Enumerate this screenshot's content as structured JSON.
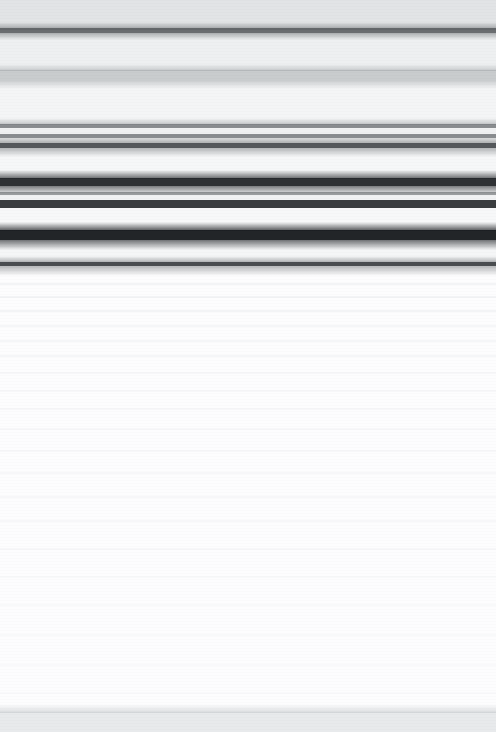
{
  "capture": {
    "width": 496,
    "height": 732,
    "condition": "horizontal-motion-blur",
    "legible_text": "none",
    "page_background": "#fdfdfe"
  },
  "regions": [
    {
      "name": "title-bar",
      "top": 0,
      "height": 28,
      "color": "#e2e4e6"
    },
    {
      "name": "title-bar-border",
      "top": 28,
      "height": 5,
      "color": "#6a6d70"
    },
    {
      "name": "secondary-bar",
      "top": 33,
      "height": 37,
      "color": "#eef0f1"
    },
    {
      "name": "section-header-band",
      "top": 70,
      "height": 11,
      "color": "#c9ccce"
    },
    {
      "name": "panel-upper",
      "top": 81,
      "height": 43,
      "color": "#f4f5f6"
    },
    {
      "name": "row-rule-1",
      "top": 124,
      "height": 4,
      "color": "#8a8d90"
    },
    {
      "name": "row-gap-1",
      "top": 128,
      "height": 6,
      "color": "#f0f1f2"
    },
    {
      "name": "row-rule-2",
      "top": 134,
      "height": 4,
      "color": "#8a8d90"
    },
    {
      "name": "row-gap-2",
      "top": 138,
      "height": 5,
      "color": "#eceded"
    },
    {
      "name": "divider-strong",
      "top": 143,
      "height": 5,
      "color": "#55585b"
    },
    {
      "name": "panel-mid",
      "top": 148,
      "height": 30,
      "color": "#f6f7f8"
    },
    {
      "name": "dark-band-1",
      "top": 178,
      "height": 8,
      "color": "#2e3134"
    },
    {
      "name": "light-gap-1",
      "top": 186,
      "height": 6,
      "color": "#e9eaeb"
    },
    {
      "name": "thin-rule-1",
      "top": 192,
      "height": 3,
      "color": "#9a9d9f"
    },
    {
      "name": "light-gap-2",
      "top": 195,
      "height": 5,
      "color": "#f1f2f3"
    },
    {
      "name": "dark-band-2",
      "top": 200,
      "height": 8,
      "color": "#3a3d40"
    },
    {
      "name": "light-gap-3",
      "top": 208,
      "height": 22,
      "color": "#f7f8f9"
    },
    {
      "name": "dark-band-3",
      "top": 230,
      "height": 10,
      "color": "#222528"
    },
    {
      "name": "light-gap-4",
      "top": 240,
      "height": 22,
      "color": "#f5f6f7"
    },
    {
      "name": "header-block-end-rule",
      "top": 262,
      "height": 4,
      "color": "#4a4d50"
    },
    {
      "name": "content-area",
      "top": 266,
      "height": 446,
      "color": "#fdfdfe"
    },
    {
      "name": "footer-bar",
      "top": 712,
      "height": 20,
      "color": "#e8eaec"
    }
  ],
  "ghost_rows": [
    {
      "top": 283,
      "height": 2,
      "opacity": 0.05
    },
    {
      "top": 296,
      "height": 2,
      "opacity": 0.05
    },
    {
      "top": 310,
      "height": 2,
      "opacity": 0.05
    },
    {
      "top": 325,
      "height": 2,
      "opacity": 0.04
    },
    {
      "top": 340,
      "height": 2,
      "opacity": 0.04
    },
    {
      "top": 355,
      "height": 2,
      "opacity": 0.04
    },
    {
      "top": 372,
      "height": 2,
      "opacity": 0.03
    },
    {
      "top": 390,
      "height": 2,
      "opacity": 0.03
    },
    {
      "top": 408,
      "height": 2,
      "opacity": 0.03
    },
    {
      "top": 428,
      "height": 2,
      "opacity": 0.03
    },
    {
      "top": 450,
      "height": 2,
      "opacity": 0.03
    },
    {
      "top": 472,
      "height": 2,
      "opacity": 0.03
    },
    {
      "top": 496,
      "height": 2,
      "opacity": 0.03
    },
    {
      "top": 520,
      "height": 2,
      "opacity": 0.03
    },
    {
      "top": 548,
      "height": 2,
      "opacity": 0.03
    },
    {
      "top": 576,
      "height": 2,
      "opacity": 0.025
    },
    {
      "top": 604,
      "height": 2,
      "opacity": 0.025
    },
    {
      "top": 634,
      "height": 2,
      "opacity": 0.025
    },
    {
      "top": 664,
      "height": 2,
      "opacity": 0.02
    },
    {
      "top": 692,
      "height": 2,
      "opacity": 0.02
    }
  ],
  "feathers": [
    {
      "top": 22,
      "height": 8,
      "from": "rgba(120,124,128,0.00)",
      "to": "rgba(90,94,98,0.55)"
    },
    {
      "top": 33,
      "height": 7,
      "from": "rgba(90,94,98,0.45)",
      "to": "rgba(120,124,128,0.00)"
    },
    {
      "top": 64,
      "height": 7,
      "from": "rgba(150,154,158,0.00)",
      "to": "rgba(150,154,158,0.45)"
    },
    {
      "top": 81,
      "height": 8,
      "from": "rgba(150,154,158,0.40)",
      "to": "rgba(150,154,158,0.00)"
    },
    {
      "top": 118,
      "height": 7,
      "from": "rgba(110,114,118,0.00)",
      "to": "rgba(110,114,118,0.40)"
    },
    {
      "top": 138,
      "height": 6,
      "from": "rgba(80,84,88,0.10)",
      "to": "rgba(80,84,88,0.45)"
    },
    {
      "top": 148,
      "height": 9,
      "from": "rgba(80,84,88,0.40)",
      "to": "rgba(80,84,88,0.00)"
    },
    {
      "top": 170,
      "height": 9,
      "from": "rgba(35,38,42,0.00)",
      "to": "rgba(35,38,42,0.70)"
    },
    {
      "top": 186,
      "height": 8,
      "from": "rgba(35,38,42,0.55)",
      "to": "rgba(35,38,42,0.00)"
    },
    {
      "top": 222,
      "height": 9,
      "from": "rgba(25,28,32,0.00)",
      "to": "rgba(25,28,32,0.75)"
    },
    {
      "top": 240,
      "height": 10,
      "from": "rgba(25,28,32,0.60)",
      "to": "rgba(25,28,32,0.00)"
    },
    {
      "top": 256,
      "height": 7,
      "from": "rgba(70,74,78,0.00)",
      "to": "rgba(70,74,78,0.45)"
    },
    {
      "top": 266,
      "height": 10,
      "from": "rgba(70,74,78,0.38)",
      "to": "rgba(70,74,78,0.00)"
    },
    {
      "top": 704,
      "height": 9,
      "from": "rgba(190,194,198,0.00)",
      "to": "rgba(190,194,198,0.55)"
    }
  ]
}
